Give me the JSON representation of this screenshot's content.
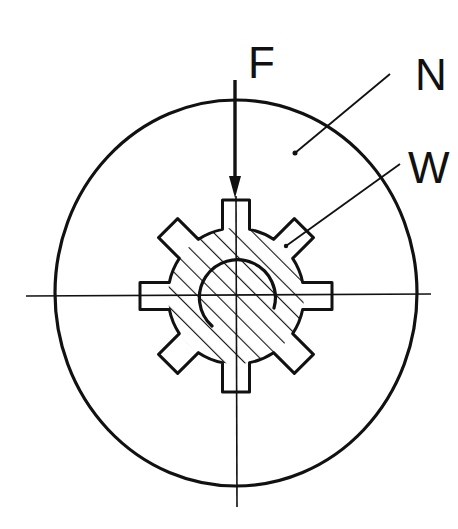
{
  "diagram": {
    "type": "technical-cross-section",
    "labels": {
      "force": "F",
      "hub": "N",
      "shaft": "W"
    },
    "colors": {
      "stroke": "#111111",
      "background": "#ffffff"
    },
    "geometry": {
      "outer_circle": {
        "cx": 236,
        "cy": 293,
        "rx": 181,
        "ry": 193
      },
      "gear_center": {
        "x": 236,
        "y": 296
      },
      "gear_body_radius": 68,
      "gear_tooth_outer_radius": 96,
      "gear_tooth_width": 27,
      "gear_tooth_count": 8,
      "inner_arc_radius": 38,
      "hatch_spacing": 14,
      "hatch_angle_deg": 45
    }
  }
}
